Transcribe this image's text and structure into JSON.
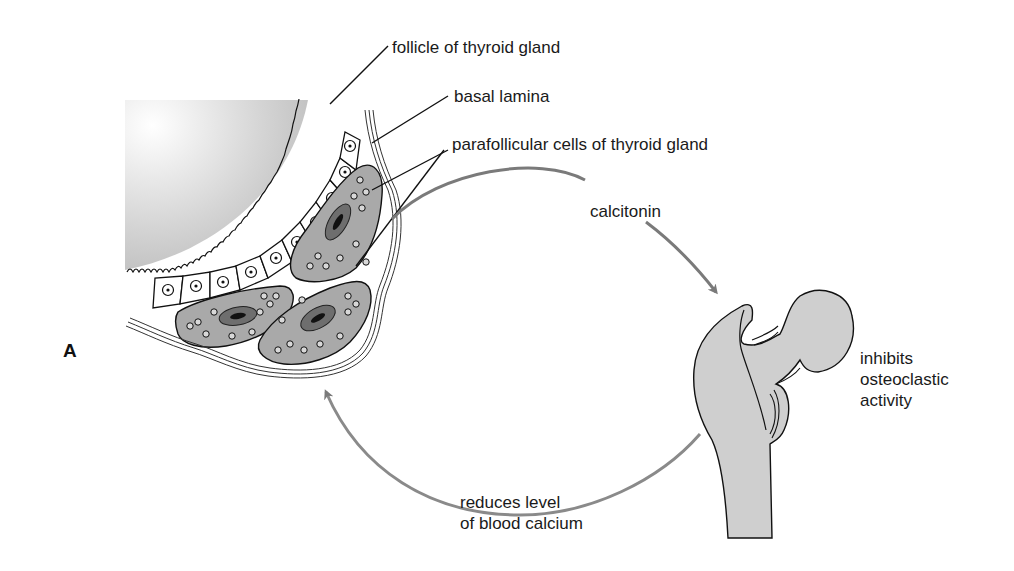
{
  "figure": {
    "panel_letter": "A",
    "colors": {
      "background": "#ffffff",
      "lumen_gradient": [
        "#b9b9b9",
        "#ffffff"
      ],
      "cell_fill": "#a9a9a9",
      "bone_fill": "#cfcfcf",
      "line": "#111111",
      "arrow": "#7a7a7a"
    }
  },
  "labels": {
    "follicle": "follicle of thyroid gland",
    "basal_lamina": "basal lamina",
    "parafollicular": "parafollicular cells of thyroid gland",
    "calcitonin": "calcitonin",
    "bone_effect": "inhibits\nosteoclastic\nactivity",
    "blood_effect": "reduces level\nof blood calcium"
  },
  "arrows": [
    {
      "name": "calcitonin-arrow",
      "from": "parafollicular cells",
      "to": "femur"
    },
    {
      "name": "return-arrow",
      "from": "femur",
      "to": "thyroid follicle"
    }
  ]
}
